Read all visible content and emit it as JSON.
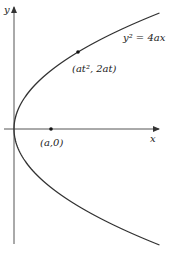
{
  "diagram": {
    "type": "parabola",
    "equation_label": "y² = 4ax",
    "axes": {
      "x_label": "x",
      "y_label": "y"
    },
    "points": [
      {
        "name": "parametric-point",
        "label": "(at², 2at)"
      },
      {
        "name": "focus",
        "label": "(a,0)"
      }
    ],
    "colors": {
      "curve": "#333333",
      "axis": "#555555",
      "text": "#222222"
    }
  }
}
